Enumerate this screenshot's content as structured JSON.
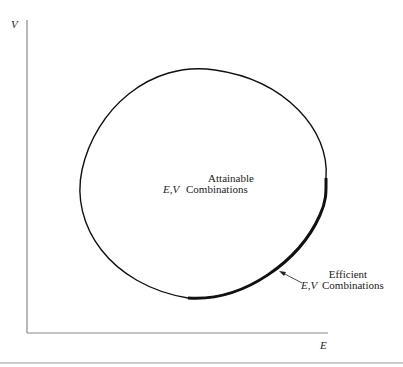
{
  "axes": {
    "y_label": "V",
    "x_label": "E"
  },
  "region": {
    "line1": "Attainable",
    "ev": "E,V",
    "line2": "Combinations"
  },
  "frontier": {
    "line1": "Efficient",
    "ev": "E,V",
    "line2": "Combinations"
  },
  "colors": {
    "axis": "#888888",
    "curve": "#111111",
    "text": "#222222"
  }
}
